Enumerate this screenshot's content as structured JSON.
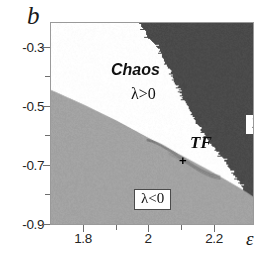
{
  "figure": {
    "axis_labels": {
      "y": "b",
      "x": "ε"
    },
    "background_color": "#ffffff",
    "frame_color": "#9a9a9a"
  },
  "annotations": {
    "chaos": "Chaos",
    "lambda_positive": "λ>0",
    "tf_point": "TF",
    "tf_marker": "+",
    "lambda_negative_right": "λ<0",
    "lambda_negative_left": "λ<0"
  },
  "colors": {
    "white_region": "#ffffff",
    "light_gray_region": "#a3a3a3",
    "dark_gray_region": "#4a4a4a",
    "text": "#1a1a1a"
  },
  "chart_data": {
    "type": "heatmap",
    "title": "",
    "xlabel": "ε",
    "ylabel": "b",
    "xlim": [
      1.7,
      2.32
    ],
    "ylim": [
      -0.9,
      -0.21
    ],
    "xticks": [
      1.8,
      2.0,
      2.2
    ],
    "xtick_labels": [
      "1.8",
      "2",
      "2.2"
    ],
    "yticks": [
      -0.3,
      -0.5,
      -0.7,
      -0.9
    ],
    "ytick_labels": [
      "-0.3",
      "-0.5",
      "-0.7",
      "-0.9"
    ],
    "xminor_ticks": [
      1.9,
      2.1,
      2.3
    ],
    "yminor_ticks": [
      -0.4,
      -0.6,
      -0.8
    ],
    "grid": false,
    "legend": "none",
    "regions": [
      {
        "name": "chaotic",
        "label": "Chaos / λ>0",
        "color": "#ffffff",
        "lyapunov_sign": "positive",
        "description": "White wedge occupying upper-left interior, bounded below by a smooth near-linear curve and on the upper-right by a jagged fractal boundary; tapers to a thin tongue toward lower right."
      },
      {
        "name": "periodic-lower",
        "label": "λ<0",
        "color": "#a3a3a3",
        "lyapunov_sign": "negative",
        "description": "Light gray region below the smooth boundary curve, lower-left of the plot."
      },
      {
        "name": "periodic-upper-right",
        "label": "λ<0",
        "color": "#4a4a4a",
        "lyapunov_sign": "negative",
        "description": "Dark gray region in the upper-right corner, separated from chaos by a rough fractal frontier."
      }
    ],
    "boundary_smooth": {
      "name": "lower chaos boundary",
      "x": [
        1.7,
        1.8,
        1.9,
        2.0,
        2.1,
        2.2,
        2.3
      ],
      "y": [
        -0.44,
        -0.49,
        -0.545,
        -0.605,
        -0.665,
        -0.725,
        -0.79
      ]
    },
    "boundary_fractal": {
      "name": "upper-right chaos frontier",
      "x": [
        1.97,
        2.03,
        2.07,
        2.11,
        2.15,
        2.19,
        2.24,
        2.29
      ],
      "y": [
        -0.21,
        -0.3,
        -0.38,
        -0.47,
        -0.55,
        -0.62,
        -0.7,
        -0.77
      ]
    },
    "special_points": [
      {
        "label": "TF",
        "x": 2.0,
        "y": -0.605,
        "marker": "+"
      }
    ]
  }
}
